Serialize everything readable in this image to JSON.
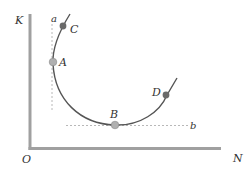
{
  "diagram": {
    "axes": {
      "y_label": "K",
      "x_label": "N",
      "origin_label": "O"
    },
    "curve_labels": {
      "start": "a",
      "end": "b"
    },
    "points": [
      {
        "id": "C",
        "label": "C",
        "style": "dark"
      },
      {
        "id": "A",
        "label": "A",
        "style": "light"
      },
      {
        "id": "B",
        "label": "B",
        "style": "light"
      },
      {
        "id": "D",
        "label": "D",
        "style": "dark"
      }
    ],
    "colors": {
      "axis": "#a0a0a0",
      "curve": "#555555",
      "point_light": "#b0b0b0",
      "point_dark": "#6a6a6a",
      "dash": "#b8b8b8"
    }
  }
}
